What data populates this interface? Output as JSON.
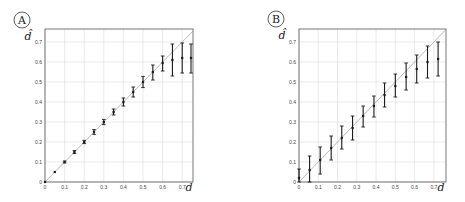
{
  "chart_data": [
    {
      "panel": "A",
      "type": "scatter",
      "title": "",
      "xlabel": "d",
      "ylabel": "d̂",
      "xlim": [
        0,
        0.755
      ],
      "ylim": [
        0,
        0.765
      ],
      "grid": true,
      "x_ticks": [
        "0",
        "0.1",
        "0.2",
        "0.3",
        "0.4",
        "0.5",
        "0.6",
        "0.7"
      ],
      "y_ticks": [
        "0",
        "0.1",
        "0.2",
        "0.3",
        "0.4",
        "0.5",
        "0.6",
        "0.7"
      ],
      "reference_line": "y = x",
      "series": [
        {
          "name": "estimate",
          "x": [
            0,
            0.05,
            0.1,
            0.15,
            0.2,
            0.25,
            0.3,
            0.35,
            0.4,
            0.45,
            0.5,
            0.55,
            0.6,
            0.65,
            0.7,
            0.75
          ],
          "y": [
            0,
            0.05,
            0.1,
            0.15,
            0.2,
            0.25,
            0.3,
            0.35,
            0.4,
            0.45,
            0.5,
            0.55,
            0.595,
            0.61,
            0.62,
            0.62
          ],
          "y_low": [
            0,
            0.048,
            0.095,
            0.143,
            0.192,
            0.238,
            0.287,
            0.335,
            0.38,
            0.425,
            0.472,
            0.51,
            0.555,
            0.53,
            0.545,
            0.545
          ],
          "y_high": [
            0,
            0.052,
            0.105,
            0.157,
            0.208,
            0.262,
            0.313,
            0.365,
            0.42,
            0.475,
            0.528,
            0.585,
            0.63,
            0.69,
            0.695,
            0.69
          ]
        }
      ]
    },
    {
      "panel": "B",
      "type": "scatter",
      "title": "",
      "xlabel": "d",
      "ylabel": "d̂",
      "xlim": [
        0,
        0.763
      ],
      "ylim": [
        0,
        0.765
      ],
      "grid": true,
      "x_ticks": [
        "0",
        "0.1",
        "0.2",
        "0.3",
        "0.4",
        "0.5",
        "0.6",
        "0.7"
      ],
      "y_ticks": [
        "0",
        "0.1",
        "0.2",
        "0.3",
        "0.4",
        "0.5",
        "0.6",
        "0.7"
      ],
      "reference_line": "y = x",
      "series": [
        {
          "name": "estimate",
          "x": [
            0,
            0.055,
            0.11,
            0.167,
            0.222,
            0.278,
            0.333,
            0.389,
            0.444,
            0.5,
            0.556,
            0.611,
            0.667,
            0.722
          ],
          "y": [
            0.02,
            0.06,
            0.11,
            0.17,
            0.22,
            0.27,
            0.33,
            0.38,
            0.435,
            0.48,
            0.525,
            0.565,
            0.6,
            0.615
          ],
          "y_low": [
            0,
            0,
            0.04,
            0.11,
            0.165,
            0.21,
            0.275,
            0.325,
            0.375,
            0.425,
            0.46,
            0.495,
            0.52,
            0.53
          ],
          "y_high": [
            0.065,
            0.13,
            0.175,
            0.23,
            0.28,
            0.33,
            0.38,
            0.43,
            0.495,
            0.54,
            0.595,
            0.635,
            0.68,
            0.7
          ]
        }
      ]
    }
  ],
  "panels": [
    {
      "label": "A",
      "frame": {
        "left": 45,
        "top": 29,
        "right": 193,
        "bottom": 182
      },
      "label_pos": [
        22,
        20
      ],
      "ylabel_pos": [
        28,
        40
      ],
      "xlabel_pos": [
        189,
        191
      ]
    },
    {
      "label": "B",
      "frame": {
        "left": 299,
        "top": 29,
        "right": 446,
        "bottom": 182
      },
      "label_pos": [
        276,
        19
      ],
      "ylabel_pos": [
        282,
        39
      ],
      "xlabel_pos": [
        441,
        191
      ]
    }
  ],
  "colors": {
    "frame": "#555555",
    "grid": "#dcdcdc",
    "reference_line": "#9a9a9a",
    "data": "#1a1a1a"
  }
}
